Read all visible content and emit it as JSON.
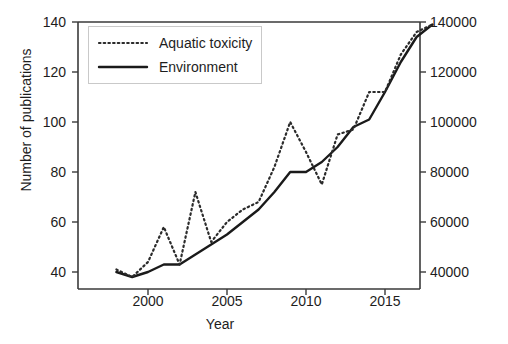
{
  "chart_data": {
    "type": "line",
    "title": "",
    "xlabel": "Year",
    "ylabel": "Number of publications",
    "ylabel_right": "",
    "xlim": [
      1998,
      2018
    ],
    "ylim": [
      36,
      140
    ],
    "ylim_right": [
      30000,
      148000
    ],
    "grid": false,
    "legend_position": "upper left",
    "xticks": [
      "2000",
      "2005",
      "2010",
      "2015"
    ],
    "xtick_values": [
      2000,
      2005,
      2010,
      2015
    ],
    "yticks_left": [
      "40",
      "60",
      "80",
      "100",
      "120",
      "140"
    ],
    "ytick_values_left": [
      40,
      60,
      80,
      100,
      120,
      140
    ],
    "yticks_right": [
      "40000",
      "60000",
      "80000",
      "100000",
      "120000",
      "140000"
    ],
    "ytick_values_right": [
      40000,
      60000,
      80000,
      100000,
      120000,
      140000
    ],
    "x": [
      1998,
      1999,
      2000,
      2001,
      2002,
      2003,
      2004,
      2005,
      2006,
      2007,
      2008,
      2009,
      2010,
      2011,
      2012,
      2013,
      2014,
      2015,
      2016,
      2017,
      2018
    ],
    "series": [
      {
        "name": "Aquatic toxicity",
        "axis": "left",
        "style": "dotted",
        "color": "#2b2b2b",
        "values": [
          41,
          38,
          44,
          58,
          43,
          72,
          52,
          60,
          65,
          68,
          82,
          100,
          88,
          75,
          95,
          97,
          112,
          112,
          127,
          136,
          139
        ]
      },
      {
        "name": "Environment",
        "axis": "right",
        "style": "solid",
        "color": "#1a1a1a",
        "values": [
          40,
          38,
          40,
          43,
          43,
          47,
          51,
          55,
          60,
          65,
          72,
          80,
          80,
          84,
          90,
          98,
          101,
          112,
          124,
          134,
          139
        ],
        "values_right_axis": [
          32000,
          30000,
          32000,
          35000,
          35000,
          39000,
          43000,
          47000,
          52000,
          57000,
          64000,
          72000,
          72000,
          76000,
          82000,
          90000,
          93000,
          104000,
          116000,
          126000,
          131000
        ]
      }
    ],
    "legend_entries": [
      "Aquatic toxicity",
      "Environment"
    ]
  }
}
